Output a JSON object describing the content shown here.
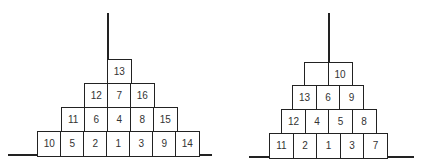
{
  "left_pyramid": {
    "rows": [
      {
        "y": 59,
        "x": 107,
        "cells": [
          "13"
        ]
      },
      {
        "y": 83,
        "x": 84,
        "cells": [
          "12",
          "7",
          "16"
        ]
      },
      {
        "y": 107,
        "x": 61,
        "cells": [
          "11",
          "6",
          "4",
          "8",
          "15"
        ]
      },
      {
        "y": 131,
        "x": 37,
        "cells": [
          "10",
          "5",
          "2",
          "1",
          "3",
          "9",
          "14"
        ]
      }
    ],
    "cell_w": 23,
    "cell_h": 24,
    "pole": {
      "x": 107,
      "y1": 13,
      "y2": 59
    },
    "base": {
      "x1": 8,
      "x2": 212,
      "y": 154
    }
  },
  "right_pyramid": {
    "rows": [
      {
        "y": 62,
        "x": 304,
        "cells": [
          "",
          "10"
        ]
      },
      {
        "y": 85,
        "x": 292,
        "cells": [
          "13",
          "6",
          "9"
        ]
      },
      {
        "y": 109,
        "x": 281,
        "cells": [
          "12",
          "4",
          "5",
          "8"
        ]
      },
      {
        "y": 133,
        "x": 269,
        "cells": [
          "11",
          "2",
          "1",
          "3",
          "7"
        ]
      }
    ],
    "cell_w": 23.5,
    "cell_h": 24,
    "pole": {
      "x": 328,
      "y1": 13,
      "y2": 62
    },
    "base": {
      "x1": 249,
      "x2": 414,
      "y": 156
    }
  }
}
